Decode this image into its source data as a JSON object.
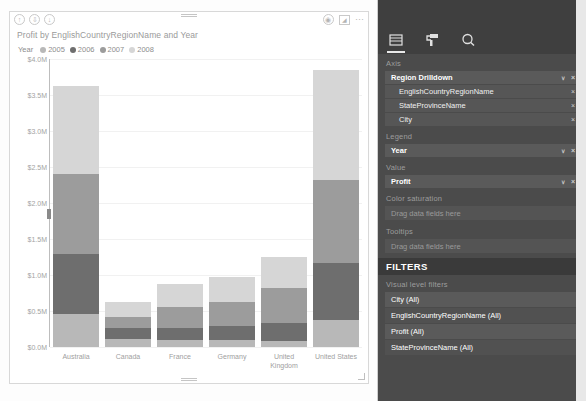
{
  "visual": {
    "title": "Profit by EnglishCountryRegionName and Year",
    "header_icons": {
      "drill_up": "drill-up-icon",
      "drill_down_expand": "expand-icon",
      "drill_down_toggle": "drill-down-icon",
      "focus": "focus-mode-icon",
      "filter": "filter-icon",
      "more": "more-options-icon"
    },
    "legend_title": "Year"
  },
  "chart_data": {
    "type": "bar",
    "subtype": "stacked-column",
    "title": "Profit by EnglishCountryRegionName and Year",
    "xlabel": "",
    "ylabel": "",
    "categories": [
      "Australia",
      "Canada",
      "France",
      "Germany",
      "United Kingdom",
      "United States"
    ],
    "series": [
      {
        "name": "2005",
        "color": "#b8b8b8",
        "values": [
          0.46,
          0.11,
          0.1,
          0.1,
          0.08,
          0.38
        ]
      },
      {
        "name": "2006",
        "color": "#6e6e6e",
        "values": [
          0.83,
          0.15,
          0.17,
          0.19,
          0.25,
          0.79
        ]
      },
      {
        "name": "2007",
        "color": "#9c9c9c",
        "values": [
          1.12,
          0.16,
          0.28,
          0.33,
          0.49,
          1.15
        ]
      },
      {
        "name": "2008",
        "color": "#d6d6d6",
        "values": [
          1.21,
          0.21,
          0.33,
          0.35,
          0.43,
          1.53
        ]
      }
    ],
    "totals": [
      3.62,
      0.63,
      0.88,
      0.97,
      1.25,
      3.85
    ],
    "ylim": [
      0,
      4.0
    ],
    "ytick_labels": [
      "$4.0M",
      "$3.5M",
      "$3.0M",
      "$2.5M",
      "$2.0M",
      "$1.5M",
      "$1.0M",
      "$0.5M",
      "$0.0M"
    ],
    "ytick_values": [
      4.0,
      3.5,
      3.0,
      2.5,
      2.0,
      1.5,
      1.0,
      0.5,
      0.0
    ],
    "grid": true,
    "legend_position": "top",
    "legend_entries": [
      "2005",
      "2006",
      "2007",
      "2008"
    ],
    "units": "USD millions"
  },
  "panel": {
    "tabs": [
      {
        "name": "fields-tab",
        "icon": "fields-grid-icon",
        "active": true
      },
      {
        "name": "format-tab",
        "icon": "paint-roller-icon",
        "active": false
      },
      {
        "name": "analytics-tab",
        "icon": "magnifier-icon",
        "active": false
      }
    ],
    "sections": {
      "axis": {
        "label": "Axis",
        "fields": [
          {
            "label": "Region Drilldown",
            "sub": false,
            "caret": "∨",
            "remove": "×"
          },
          {
            "label": "EnglishCountryRegionName",
            "sub": true,
            "remove": "×"
          },
          {
            "label": "StateProvinceName",
            "sub": true,
            "remove": "×"
          },
          {
            "label": "City",
            "sub": true,
            "remove": "×"
          }
        ]
      },
      "legend": {
        "label": "Legend",
        "fields": [
          {
            "label": "Year",
            "sub": false,
            "caret": "∨",
            "remove": "×"
          }
        ]
      },
      "value": {
        "label": "Value",
        "fields": [
          {
            "label": "Profit",
            "sub": false,
            "caret": "∨",
            "remove": "×"
          }
        ]
      },
      "color_saturation": {
        "label": "Color saturation",
        "placeholder": "Drag data fields here"
      },
      "tooltips": {
        "label": "Tooltips",
        "placeholder": "Drag data fields here"
      }
    },
    "filters": {
      "heading": "FILTERS",
      "subheading": "Visual level filters",
      "items": [
        "City (All)",
        "EnglishCountryRegionName (All)",
        "Profit (All)",
        "StateProvinceName (All)"
      ]
    }
  },
  "colors": {
    "panel_bg": "#4b4b4b",
    "panel_dark": "#3f3f3f",
    "pill_bg": "#5a5a5a",
    "series_2005": "#b8b8b8",
    "series_2006": "#6e6e6e",
    "series_2007": "#9c9c9c",
    "series_2008": "#d6d6d6"
  }
}
